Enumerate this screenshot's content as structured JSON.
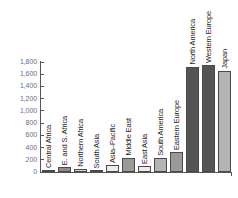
{
  "chart_data": {
    "type": "bar",
    "title": "",
    "subtitle": "",
    "xlabel": "",
    "ylabel": "",
    "ylim": [
      0,
      1800
    ],
    "grid": false,
    "legend": "none",
    "ytick_labels": [
      "1,800",
      "1,600",
      "1,400",
      "1,200",
      "1,000",
      "800",
      "600",
      "400",
      "200",
      "0"
    ],
    "ytick_values": [
      1800,
      1600,
      1400,
      1200,
      1000,
      800,
      600,
      400,
      200,
      0
    ],
    "categories": [
      "Central Africa",
      "E. and S. Africa",
      "Northern Africa",
      "South Asia",
      "Asia–Pacific",
      "Middle East",
      "East Asia",
      "South America",
      "Eastern Europe",
      "North America",
      "Western Europe",
      "Japan"
    ],
    "values": [
      30,
      75,
      45,
      25,
      110,
      230,
      95,
      235,
      335,
      1720,
      1750,
      1655
    ],
    "bar_colors": [
      "#8d8d8d",
      "#8d8d8d",
      "#d8d8d8",
      "#c9c9c9",
      "#ececec",
      "#9a9a9a",
      "#ececec",
      "#b4b4b4",
      "#9a9a9a",
      "#545454",
      "#545454",
      "#b4b4b4"
    ]
  },
  "axis": {
    "line_color": "#555555",
    "tick_label_color": "#6f6f6f",
    "category_label_color": "#1f1f1f"
  }
}
